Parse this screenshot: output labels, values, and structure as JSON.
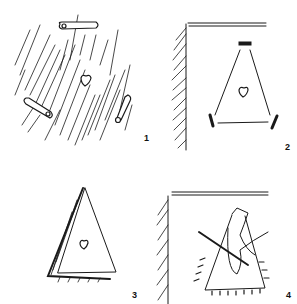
{
  "figure": {
    "panels": [
      {
        "label": "1",
        "content": "fabric with three safety pins and a heart shape at center"
      },
      {
        "label": "2",
        "content": "folded corner with triangle drawn, heart at center, pin marks at corners"
      },
      {
        "label": "3",
        "content": "triangle of fabric folded with heart at center"
      },
      {
        "label": "4",
        "content": "needle and thread stitching along triangle edge at folded corner"
      }
    ]
  },
  "colors": {
    "ink": "#1a1a1a",
    "background": "#ffffff"
  }
}
